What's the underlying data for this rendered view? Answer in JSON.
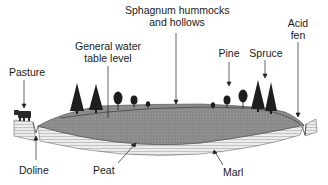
{
  "diagram": {
    "type": "cross-section",
    "labels": {
      "sphagnum_line1": "Sphagnum hummocks",
      "sphagnum_line2": "and hollows",
      "acid_line1": "Acid",
      "acid_line2": "fen",
      "water_line1": "General water",
      "water_line2": "table level",
      "pine": "Pine",
      "spruce": "Spruce",
      "pasture": "Pasture",
      "doline": "Doline",
      "peat": "Peat",
      "marl": "Marl"
    },
    "colors": {
      "peat": "#8c8c8c",
      "marl": "#e6e6e6",
      "marl_lines": "#9a9a9a",
      "tree": "#1a1a1a",
      "outline": "#333333"
    }
  }
}
